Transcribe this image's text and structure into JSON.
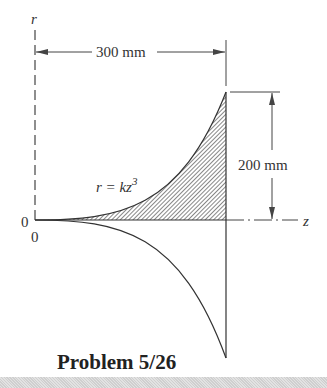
{
  "diagram": {
    "axis_r_label": "r",
    "axis_z_label": "z",
    "origin_left_label": "0",
    "origin_below_label": "0",
    "width_dimension": "300 mm",
    "height_dimension": "200 mm",
    "curve_equation_lhs": "r = kz",
    "curve_equation_exp": "3",
    "title": "Problem 5/26",
    "colors": {
      "line": "#333333",
      "hatch": "#555555",
      "band": "#d8d8d8"
    }
  }
}
